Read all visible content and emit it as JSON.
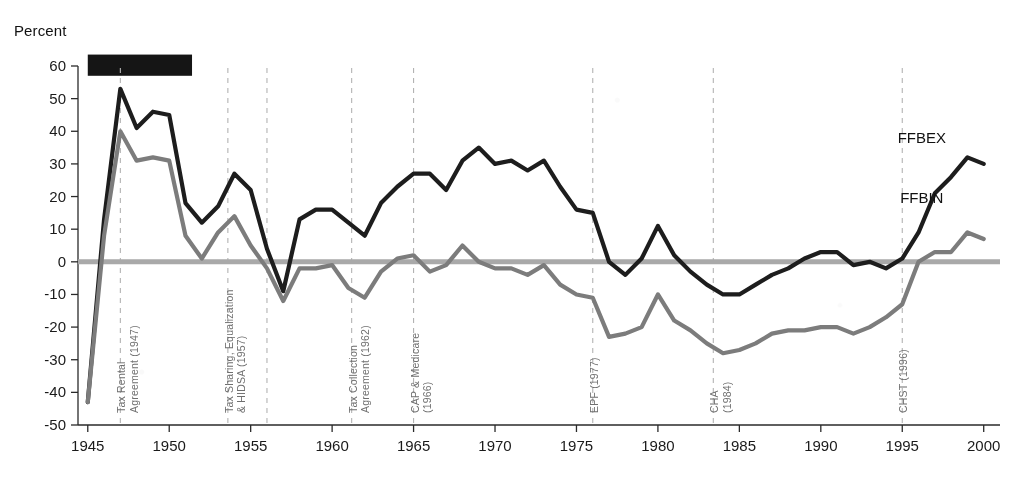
{
  "chart_data": {
    "type": "line",
    "title": "",
    "ylabel": "Percent",
    "xlabel": "",
    "ylim": [
      -50,
      60
    ],
    "xlim": [
      1944.4,
      2001.0
    ],
    "yticks": [
      60,
      50,
      40,
      30,
      20,
      10,
      0,
      -10,
      -20,
      -30,
      -40,
      -50
    ],
    "ytick_labels": [
      "60",
      "50",
      "40",
      "30",
      "20",
      "10",
      "0",
      "-10",
      "-20",
      "-30",
      "-40",
      "-50"
    ],
    "xticks": [
      1945,
      1950,
      1955,
      1960,
      1965,
      1970,
      1975,
      1980,
      1985,
      1990,
      1995,
      2000
    ],
    "xtick_labels": [
      "1945",
      "1950",
      "1955",
      "1960",
      "1965",
      "1970",
      "1975",
      "1980",
      "1985",
      "1990",
      "1995",
      "2000"
    ],
    "grid": false,
    "legend_position": "inline-right",
    "zero_line": 0,
    "colors": {
      "ffbex": "#1d1d1d",
      "ffbin": "#7c7c7c",
      "zero_line": "#a9a9a9",
      "annotation_line": "#b3b3b3",
      "redaction": "#151515"
    },
    "series": [
      {
        "name": "FFBEX",
        "color": "#1d1d1d",
        "label_x": 1996.2,
        "label_y": 36.5,
        "x": [
          1945,
          1946,
          1947,
          1948,
          1949,
          1950,
          1951,
          1952,
          1953,
          1954,
          1955,
          1956,
          1957,
          1958,
          1959,
          1960,
          1961,
          1962,
          1963,
          1964,
          1965,
          1966,
          1967,
          1968,
          1969,
          1970,
          1971,
          1972,
          1973,
          1974,
          1975,
          1976,
          1977,
          1978,
          1979,
          1980,
          1981,
          1982,
          1983,
          1984,
          1985,
          1986,
          1987,
          1988,
          1989,
          1990,
          1991,
          1992,
          1993,
          1994,
          1995,
          1996,
          1997,
          1998,
          1999,
          2000
        ],
        "y": [
          -43,
          13,
          53,
          41,
          46,
          45,
          18,
          12,
          17,
          27,
          22,
          4,
          -9,
          13,
          16,
          16,
          12,
          8,
          18,
          23,
          27,
          27,
          22,
          31,
          35,
          30,
          31,
          28,
          31,
          23,
          16,
          15,
          0,
          -4,
          1,
          11,
          2,
          -3,
          -7,
          -10,
          -10,
          -7,
          -4,
          -2,
          1,
          3,
          3,
          -1,
          0,
          -2,
          1,
          9,
          21,
          26,
          32,
          30
        ]
      },
      {
        "name": "FFBIN",
        "color": "#7c7c7c",
        "label_x": 1996.2,
        "label_y": 18.0,
        "x": [
          1945,
          1946,
          1947,
          1948,
          1949,
          1950,
          1951,
          1952,
          1953,
          1954,
          1955,
          1956,
          1957,
          1958,
          1959,
          1960,
          1961,
          1962,
          1963,
          1964,
          1965,
          1966,
          1967,
          1968,
          1969,
          1970,
          1971,
          1972,
          1973,
          1974,
          1975,
          1976,
          1977,
          1978,
          1979,
          1980,
          1981,
          1982,
          1983,
          1984,
          1985,
          1986,
          1987,
          1988,
          1989,
          1990,
          1991,
          1992,
          1993,
          1994,
          1995,
          1996,
          1997,
          1998,
          1999,
          2000
        ],
        "y": [
          -43,
          8,
          40,
          31,
          32,
          31,
          8,
          1,
          9,
          14,
          5,
          -2,
          -12,
          -2,
          -2,
          -1,
          -8,
          -11,
          -3,
          1,
          2,
          -3,
          -1,
          5,
          0,
          -2,
          -2,
          -4,
          -1,
          -7,
          -10,
          -11,
          -23,
          -22,
          -20,
          -10,
          -18,
          -21,
          -25,
          -28,
          -27,
          -25,
          -22,
          -21,
          -21,
          -20,
          -20,
          -22,
          -20,
          -17,
          -13,
          0,
          3,
          3,
          9,
          7
        ]
      }
    ],
    "annotations": [
      {
        "x": 1947,
        "label": "Tax Rental\nAgreement (1947)",
        "lines": [
          "Tax Rental",
          "Agreement (1947)"
        ]
      },
      {
        "x": 1953.6,
        "label": "Tax Sharing, Equalization\n& HIDSA (1957)",
        "lines": [
          "Tax Sharing, Equalization",
          "& HIDSA (1957)"
        ]
      },
      {
        "x": 1956,
        "label": "",
        "lines": []
      },
      {
        "x": 1961.2,
        "label": "Tax Collection\nAgreement (1962)",
        "lines": [
          "Tax Collection",
          "Agreement (1962)"
        ]
      },
      {
        "x": 1965,
        "label": "CAP & Medicare\n(1966)",
        "lines": [
          "CAP & Medicare",
          "(1966)"
        ]
      },
      {
        "x": 1976,
        "label": "EPF (1977)",
        "lines": [
          "EPF (1977)"
        ]
      },
      {
        "x": 1983.4,
        "label": "CHA\n(1984)",
        "lines": [
          "CHA",
          "(1984)"
        ]
      },
      {
        "x": 1995,
        "label": "CHST (1996)",
        "lines": [
          "CHST (1996)"
        ]
      }
    ],
    "redaction_bar": {
      "x0": 1945.0,
      "x1": 1951.4,
      "y0": 57.0,
      "y1": 63.5,
      "color": "#151515"
    }
  }
}
